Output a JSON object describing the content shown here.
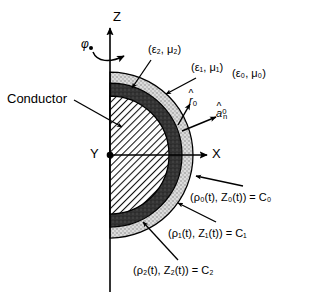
{
  "figure": {
    "type": "cross-section-diagram",
    "axes": {
      "z_label": "Z",
      "x_label": "X",
      "y_label": "Y",
      "azimuth_label": "φ"
    },
    "regions": [
      {
        "name": "conductor",
        "label": "Conductor",
        "fill": "diagonal-hatch"
      },
      {
        "name": "layer-2",
        "label": "(ε₂, μ₂)",
        "eps": "ε",
        "eps_sub": "2",
        "mu": "μ",
        "mu_sub": "2",
        "fill": "dark-gray",
        "color": "#3a3a3a"
      },
      {
        "name": "layer-1",
        "label": "(ε₁, μ₁)",
        "eps": "ε",
        "eps_sub": "1",
        "mu": "μ",
        "mu_sub": "1",
        "fill": "light-speckle",
        "color": "#d2d2d2"
      },
      {
        "name": "free-space",
        "label": "(ε₀, μ₀)",
        "eps": "ε",
        "eps_sub": "0",
        "mu": "μ",
        "mu_sub": "0",
        "fill": "white",
        "color": "#ffffff"
      }
    ],
    "vectors": [
      {
        "name": "r-hat-0",
        "base": "r",
        "sub": "0",
        "hat": true
      },
      {
        "name": "a-hat-n-0",
        "base": "a",
        "sub": "n",
        "sup": "0",
        "hat": true
      }
    ],
    "curves": [
      {
        "name": "c0",
        "text": "(ρ₀(t), Z₀(t)) = C₀",
        "rho": "ρ",
        "sub": "0",
        "zed": "Z",
        "result": "C",
        "boundary": "outer"
      },
      {
        "name": "c1",
        "text": "(ρ₁(t), Z₁(t)) = C₁",
        "rho": "ρ",
        "sub": "1",
        "zed": "Z",
        "result": "C",
        "boundary": "middle"
      },
      {
        "name": "c2",
        "text": "(ρ₂(t), Z₂(t)) = C₂",
        "rho": "ρ",
        "sub": "2",
        "zed": "Z",
        "result": "C",
        "boundary": "inner"
      }
    ],
    "geometry": {
      "origin_x": 110,
      "origin_y": 155,
      "radius_c0": 83,
      "radius_c1": 72,
      "radius_c2": 59
    },
    "colors": {
      "stroke": "#000000",
      "layer2_fill": "#3a3a3a",
      "layer1_fill": "#d4d4d4",
      "background": "#ffffff"
    }
  }
}
